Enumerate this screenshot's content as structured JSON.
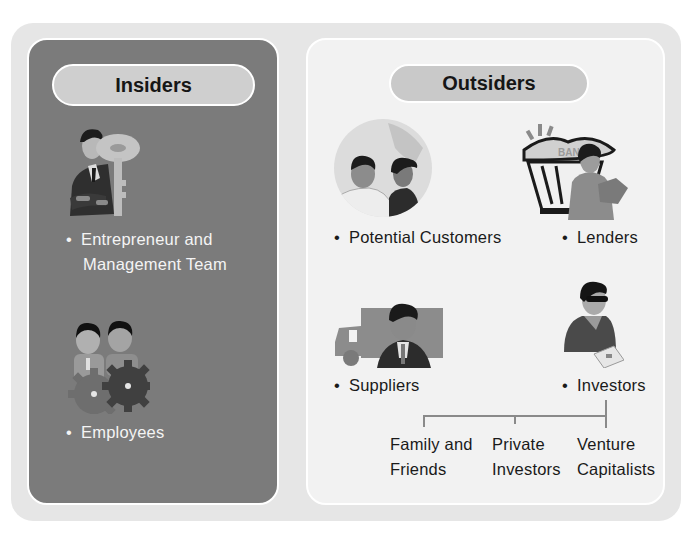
{
  "diagram": {
    "insiders": {
      "title": "Insiders",
      "items": [
        {
          "label_line1": "Entrepreneur and",
          "label_line2": "Management Team",
          "icon": "businessman-with-key-icon"
        },
        {
          "label": "Employees",
          "icon": "workers-with-gears-icon"
        }
      ]
    },
    "outsiders": {
      "title": "Outsiders",
      "items": [
        {
          "label": "Potential Customers",
          "icon": "customers-globe-icon"
        },
        {
          "label": "Lenders",
          "icon": "bank-lender-icon",
          "sign_text": "BAN"
        },
        {
          "label": "Suppliers",
          "icon": "supplier-truck-icon"
        },
        {
          "label": "Investors",
          "icon": "investor-icon"
        }
      ],
      "investor_types": [
        {
          "line1": "Family and",
          "line2": "Friends"
        },
        {
          "line1": "Private",
          "line2": "Investors"
        },
        {
          "line1": "Venture",
          "line2": "Capitalists"
        }
      ]
    },
    "bullet": "•",
    "colors": {
      "outer_bg": "#e6e6e6",
      "insiders_bg": "#7b7b7b",
      "outsiders_bg": "#f2f2f2",
      "pill_bg": "#cfcfcf",
      "connector": "#8a8a8a"
    }
  }
}
